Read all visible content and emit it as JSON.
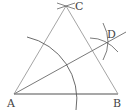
{
  "diagram": {
    "type": "geometric-construction",
    "points": {
      "A": {
        "label": "A",
        "x": 14,
        "y": 94
      },
      "B": {
        "label": "B",
        "x": 118,
        "y": 94
      },
      "C": {
        "label": "C",
        "x": 66,
        "y": 6
      },
      "D": {
        "label": "D",
        "x": 106,
        "y": 43
      }
    },
    "colors": {
      "line": "#8a8a8a",
      "arc": "#5a5a5a",
      "label": "#444444"
    }
  }
}
